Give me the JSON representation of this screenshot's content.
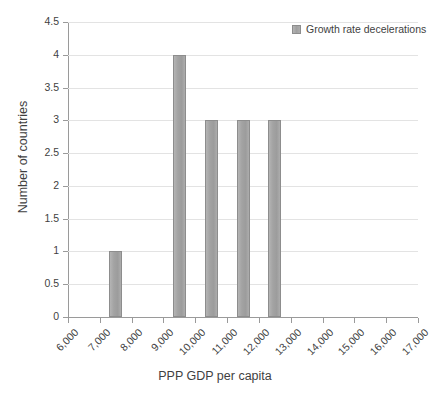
{
  "chart_data": {
    "type": "bar",
    "title": "",
    "xlabel": "PPP GDP per capita",
    "ylabel": "Number of countries",
    "ylim": [
      0,
      4.5
    ],
    "xlim": [
      6000,
      17000
    ],
    "grid": "horizontal",
    "legend_position": "top-right",
    "y_ticks": [
      "0",
      "0.5",
      "1",
      "1.5",
      "2",
      "2.5",
      "3",
      "3.5",
      "4",
      "4.5"
    ],
    "y_tick_values": [
      0,
      0.5,
      1,
      1.5,
      2,
      2.5,
      3,
      3.5,
      4,
      4.5
    ],
    "x_ticks": [
      "6,000",
      "7,000",
      "8,000",
      "9,000",
      "10,000",
      "11,000",
      "12,000",
      "13,000",
      "14,000",
      "15,000",
      "16,000",
      "17,000"
    ],
    "x_tick_values": [
      6000,
      7000,
      8000,
      9000,
      10000,
      11000,
      12000,
      13000,
      14000,
      15000,
      16000,
      17000
    ],
    "series": [
      {
        "name": "Growth rate decelerations",
        "color": "#a3a3a3",
        "bins": [
          {
            "bin_label": "6,000-7,000",
            "center": 6500,
            "value": 0
          },
          {
            "bin_label": "7,000-8,000",
            "center": 7500,
            "value": 1
          },
          {
            "bin_label": "8,000-9,000",
            "center": 8500,
            "value": 0
          },
          {
            "bin_label": "9,000-10,000",
            "center": 9500,
            "value": 4
          },
          {
            "bin_label": "10,000-11,000",
            "center": 10500,
            "value": 3
          },
          {
            "bin_label": "11,000-12,000",
            "center": 11500,
            "value": 3
          },
          {
            "bin_label": "12,000-13,000",
            "center": 12500,
            "value": 3
          },
          {
            "bin_label": "13,000-14,000",
            "center": 13500,
            "value": 0
          },
          {
            "bin_label": "14,000-15,000",
            "center": 14500,
            "value": 0
          },
          {
            "bin_label": "15,000-16,000",
            "center": 15500,
            "value": 0
          },
          {
            "bin_label": "16,000-17,000",
            "center": 16500,
            "value": 0
          }
        ],
        "values": [
          0,
          1,
          0,
          4,
          3,
          3,
          3,
          0,
          0,
          0,
          0
        ]
      }
    ]
  },
  "legend": {
    "entries": [
      {
        "label": "Growth rate decelerations",
        "color": "#a3a3a3"
      }
    ]
  },
  "colors": {
    "bar_fill": "#a3a3a3",
    "bar_border": "#8d8d8d",
    "gridline": "#e3e3e3",
    "axis": "#9a9a9a",
    "text": "#3f3f3f",
    "background": "#ffffff"
  }
}
